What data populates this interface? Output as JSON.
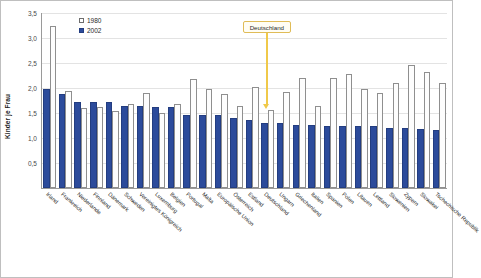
{
  "chart_data": {
    "type": "bar",
    "title": "",
    "subtitle": "",
    "xlabel": "",
    "ylabel": "Kinder je Frau",
    "ylim": [
      0,
      3.5
    ],
    "yticks": [
      0.5,
      1.0,
      1.5,
      2.0,
      2.5,
      3.0,
      3.5
    ],
    "ytick_labels": [
      "0,5",
      "1,0",
      "1,5",
      "2,0",
      "2,5",
      "3,0",
      "3,5"
    ],
    "grid": true,
    "legend_position": "top-left-inside",
    "categories": [
      "Irland",
      "Frankreich",
      "Niederlande",
      "Finnland",
      "Dänemark",
      "Schweden",
      "Vereinigtes Königreich",
      "Luxemburg",
      "Belgien",
      "Portugal",
      "Malta",
      "Europäische Union",
      "Österreich",
      "Estland",
      "Deutschland",
      "Ungarn",
      "Griechenland",
      "Italien",
      "Spanien",
      "Polen",
      "Litauen",
      "Lettland",
      "Slowenien",
      "Zypern",
      "Slowakei",
      "Tschechische Republik"
    ],
    "series": [
      {
        "name": "1980",
        "color": "#ffffff",
        "values": [
          3.25,
          1.95,
          1.6,
          1.63,
          1.55,
          1.68,
          1.9,
          1.5,
          1.68,
          2.18,
          1.99,
          1.88,
          1.65,
          2.02,
          1.56,
          1.92,
          2.21,
          1.64,
          2.2,
          2.28,
          1.99,
          1.9,
          2.11,
          2.46,
          2.32,
          2.1
        ]
      },
      {
        "name": "2002",
        "color": "#2c4b9b",
        "values": [
          1.98,
          1.88,
          1.73,
          1.72,
          1.72,
          1.65,
          1.64,
          1.63,
          1.62,
          1.47,
          1.46,
          1.46,
          1.4,
          1.37,
          1.31,
          1.3,
          1.27,
          1.26,
          1.25,
          1.24,
          1.24,
          1.24,
          1.21,
          1.21,
          1.19,
          1.17
        ]
      }
    ],
    "annotations": [
      {
        "text": "Deutschland",
        "points_to": "Deutschland",
        "color": "#f0c94a"
      }
    ]
  }
}
